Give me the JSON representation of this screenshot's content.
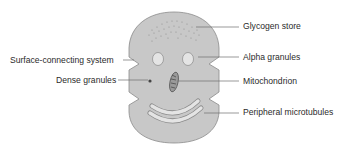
{
  "diagram": {
    "colors": {
      "cell_fill": "#c8c8c8",
      "outline": "#8a8a8a",
      "line": "#6e6e6e",
      "organelle": "#e4e4e4",
      "text": "#2b2b2b"
    },
    "labels": {
      "glycogen_store": "Glycogen store",
      "alpha_granules": "Alpha granules",
      "mitochondrion": "Mitochondrion",
      "peripheral_microtubules": "Peripheral microtubules",
      "surface_connecting_system": "Surface-connecting system",
      "dense_granules": "Dense granules"
    }
  }
}
